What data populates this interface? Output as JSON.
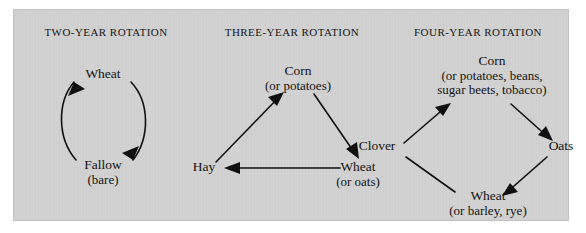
{
  "figure": {
    "kind": "crop-rotation-diagram",
    "background_color": "#d2d2d2",
    "ink_color": "#0d0d0d",
    "page_color": "#ffffff"
  },
  "columns": [
    {
      "id": "two-year",
      "title": "TWO-YEAR ROTATION",
      "layout": "circle",
      "nodes": [
        {
          "id": "wheat",
          "main": "Wheat",
          "sub": ""
        },
        {
          "id": "fallow",
          "main": "Fallow",
          "sub": "(bare)"
        }
      ],
      "edges": [
        {
          "from": "fallow",
          "to": "wheat",
          "arrow": true,
          "style": "curved"
        },
        {
          "from": "wheat",
          "to": "fallow",
          "arrow": true,
          "style": "curved"
        }
      ]
    },
    {
      "id": "three-year",
      "title": "THREE-YEAR ROTATION",
      "layout": "triangle",
      "nodes": [
        {
          "id": "corn",
          "main": "Corn",
          "sub": "(or potatoes)"
        },
        {
          "id": "wheat",
          "main": "Wheat",
          "sub": "(or oats)"
        },
        {
          "id": "hay",
          "main": "Hay",
          "sub": ""
        }
      ],
      "edges": [
        {
          "from": "hay",
          "to": "corn",
          "arrow": true,
          "style": "straight"
        },
        {
          "from": "corn",
          "to": "wheat",
          "arrow": true,
          "style": "straight"
        },
        {
          "from": "wheat",
          "to": "hay",
          "arrow": true,
          "style": "straight"
        }
      ]
    },
    {
      "id": "four-year",
      "title": "FOUR-YEAR ROTATION",
      "layout": "diamond",
      "nodes": [
        {
          "id": "corn",
          "main": "Corn",
          "sub": "(or potatoes, beans,",
          "sub2": "sugar beets, tobacco)"
        },
        {
          "id": "oats",
          "main": "Oats",
          "sub": ""
        },
        {
          "id": "wheat",
          "main": "Wheat",
          "sub": "(or barley, rye)"
        },
        {
          "id": "clover",
          "main": "Clover",
          "sub": ""
        }
      ],
      "edges": [
        {
          "from": "clover",
          "to": "corn",
          "arrow": true,
          "style": "straight"
        },
        {
          "from": "corn",
          "to": "oats",
          "arrow": true,
          "style": "straight"
        },
        {
          "from": "oats",
          "to": "wheat",
          "arrow": true,
          "style": "straight"
        },
        {
          "from": "wheat",
          "to": "clover",
          "arrow": false,
          "style": "straight"
        }
      ]
    }
  ]
}
